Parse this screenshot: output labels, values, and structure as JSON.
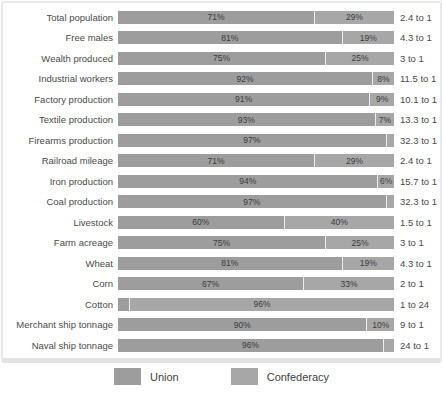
{
  "chart_data": {
    "type": "bar",
    "subtype": "horizontal-stacked-percent",
    "categories": [
      "Total population",
      "Free males",
      "Wealth produced",
      "Industrial workers",
      "Factory production",
      "Textile production",
      "Firearms production",
      "Railroad mileage",
      "Iron production",
      "Coal production",
      "Livestock",
      "Farm acreage",
      "Wheat",
      "Corn",
      "Cotton",
      "Merchant ship tonnage",
      "Naval ship tonnage"
    ],
    "series": [
      {
        "name": "Union",
        "values": [
          71,
          81,
          75,
          92,
          91,
          93,
          97,
          71,
          94,
          97,
          60,
          75,
          81,
          67,
          4,
          90,
          96
        ]
      },
      {
        "name": "Confederacy",
        "values": [
          29,
          19,
          25,
          8,
          9,
          7,
          3,
          29,
          6,
          3,
          40,
          25,
          19,
          33,
          96,
          10,
          4
        ]
      }
    ],
    "ratios": [
      "2.4 to 1",
      "4.3 to 1",
      "3 to 1",
      "11.5 to 1",
      "10.1 to 1",
      "13.3 to 1",
      "32.3 to 1",
      "2.4 to 1",
      "15.7 to 1",
      "32.3 to 1",
      "1.5 to 1",
      "3 to 1",
      "4.3 to 1",
      "2 to 1",
      "1 to 24",
      "9 to 1",
      "24 to 1"
    ],
    "xlim": [
      0,
      100
    ],
    "grid": false,
    "legend_position": "bottom",
    "colors": {
      "union": "#9d9d9d",
      "confederacy": "#a7a7a7",
      "label_text": "#4a4a4a",
      "percent_text": "#3c3c3c",
      "panel_border": "#e5e5e5"
    }
  },
  "legend": {
    "union_label": "Union",
    "confederacy_label": "Confederacy"
  }
}
